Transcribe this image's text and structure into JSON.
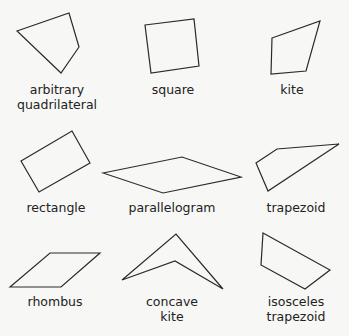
{
  "figure": {
    "stroke_color": "#2a2a2a",
    "background": "#f7f7f5",
    "shapes": [
      {
        "name": "arbitrary quadrilateral",
        "label": "arbitrary\nquadrilateral",
        "points": "17,31 69,13 79,47 61,73",
        "label_pos": [
          57,
          82
        ]
      },
      {
        "name": "square",
        "label": "square",
        "points": "145,25 194,19 199,66 151,73",
        "label_pos": [
          173,
          82
        ]
      },
      {
        "name": "kite",
        "label": "kite",
        "points": "272,38 320,21 306,71 271,74",
        "label_pos": [
          292,
          82
        ]
      },
      {
        "name": "rectangle",
        "label": "rectangle",
        "points": "21,161 72,131 90,163 39,192",
        "label_pos": [
          56,
          200
        ]
      },
      {
        "name": "parallelogram",
        "label": "parallelogram",
        "points": "103,173 182,157 241,177 163,193",
        "label_pos": [
          172,
          200
        ]
      },
      {
        "name": "trapezoid",
        "label": "trapezoid",
        "points": "256,163 277,149 339,144 268,191",
        "label_pos": [
          296,
          200
        ]
      },
      {
        "name": "rhombus",
        "label": "rhombus",
        "points": "10,287 50,253 100,253 61,287",
        "label_pos": [
          55,
          294
        ]
      },
      {
        "name": "concave kite",
        "label": "concave\nkite",
        "points": "122,280 176,234 223,289 175,261",
        "label_pos": [
          172,
          294
        ]
      },
      {
        "name": "isosceles trapezoid",
        "label": "isosceles\ntrapezoid",
        "points": "263,233 330,270 305,289 261,265",
        "label_pos": [
          296,
          294
        ]
      }
    ]
  }
}
